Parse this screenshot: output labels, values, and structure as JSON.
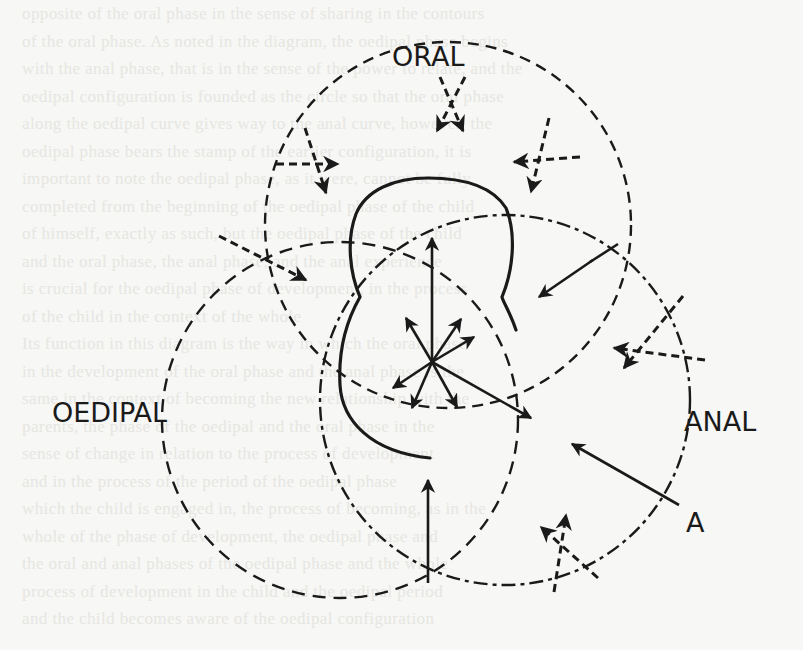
{
  "figure": {
    "labels": {
      "oral": "ORAL",
      "oedipal": "OEDIPAL",
      "anal": "ANAL",
      "point_a": "A"
    },
    "circles": [
      {
        "id": "oral",
        "cx": 448,
        "cy": 225,
        "r": 183
      },
      {
        "id": "oedipal",
        "cx": 340,
        "cy": 420,
        "r": 178
      },
      {
        "id": "anal",
        "cx": 505,
        "cy": 400,
        "r": 185
      }
    ],
    "center": {
      "x": 432,
      "y": 362
    },
    "colors": {
      "ink": "#1a1a1a",
      "paper": "#f7f7f5",
      "bleed_through": "#e6e6e2"
    }
  },
  "background_text": {
    "lines": [
      "opposite of the oral phase in the sense of sharing in the contours",
      "of the oral phase. As noted in the diagram, the oedipal phase begins",
      "with the anal phase, that is in the sense of the power to relate, and the",
      "oedipal configuration is founded as the circle so that the oral phase",
      "along the oedipal curve gives way to the anal curve, however, the",
      "oedipal phase bears the stamp of the earlier configuration, it is",
      "important to note the oedipal phase, as it were, cannot be fully",
      "completed from the beginning of the oedipal phase of the child",
      "of himself, exactly as such, but the oedipal phase of the child",
      "and the oral phase, the anal phase, and the anal experience",
      "is crucial for the oedipal phase of development, in the process",
      "of the child in the context of the whole",
      "Its function in this diagram is the way in which the oral phase",
      "in the development of the oral phase and the anal phase is the",
      "same in the context of becoming the new relationship with the",
      "parents, the phase of the oedipal and the oral phase in the",
      "sense of change in relation to the process of development",
      "and in the process of the period of the oedipal phase",
      "which the child is engaged in, the process of becoming, as in the",
      "whole of the phase of development, the oedipal phase and",
      "the oral and anal phases of the oedipal phase and the whole",
      "process of development in the child and the oedipal period",
      "and the child becomes aware of the oedipal configuration"
    ]
  }
}
